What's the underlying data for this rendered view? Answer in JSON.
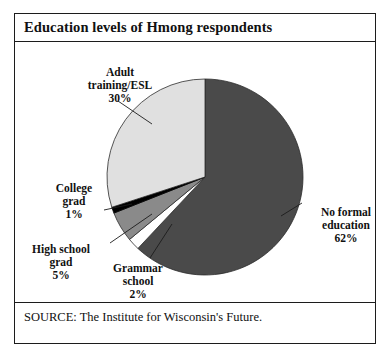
{
  "figure": {
    "title": "Education levels of Hmong respondents",
    "source": "SOURCE: The Institute for Wisconsin's Future.",
    "border_color": "#1c1c1c",
    "background": "#ffffff"
  },
  "chart_data": {
    "type": "pie",
    "title": "Education levels of Hmong respondents",
    "xlabel": "",
    "ylabel": "",
    "legend": "none",
    "grid": false,
    "total": 100,
    "unit": "%",
    "start_angle_deg": 0,
    "direction": "clockwise",
    "categories": [
      "No formal education",
      "Grammar school",
      "High school grad",
      "College grad",
      "Adult training/ESL"
    ],
    "values": [
      62,
      2,
      5,
      1,
      30
    ],
    "colors": [
      "#4a4a4a",
      "#ffffff",
      "#8a8a8a",
      "#000000",
      "#e0e0e0"
    ],
    "slices": [
      {
        "name": "No formal education",
        "label_line1": "No formal",
        "label_line2": "education",
        "label_value": "62%",
        "value": 62,
        "color": "#4a4a4a"
      },
      {
        "name": "Grammar school",
        "label_line1": "Grammar",
        "label_line2": "school",
        "label_value": "2%",
        "value": 2,
        "color": "#ffffff"
      },
      {
        "name": "High school grad",
        "label_line1": "High school",
        "label_line2": "grad",
        "label_value": "5%",
        "value": 5,
        "color": "#8a8a8a"
      },
      {
        "name": "College grad",
        "label_line1": "College",
        "label_line2": "grad",
        "label_value": "1%",
        "value": 1,
        "color": "#000000"
      },
      {
        "name": "Adult training/ESL",
        "label_line1": "Adult",
        "label_line2": "training/ESL",
        "label_value": "30%",
        "value": 30,
        "color": "#e0e0e0"
      }
    ]
  }
}
